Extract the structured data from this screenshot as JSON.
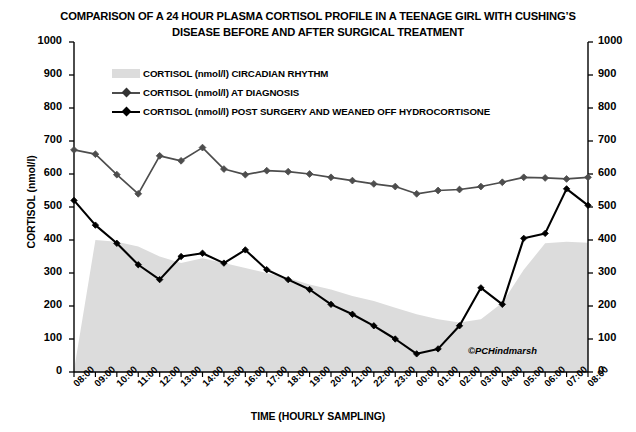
{
  "chart_data": {
    "type": "line",
    "title": "COMPARISON OF A 24 HOUR PLASMA CORTISOL PROFILE IN A TEENAGE GIRL WITH CUSHING’S DISEASE BEFORE AND AFTER SURGICAL TREATMENT",
    "xlabel": "TIME (HOURLY SAMPLING)",
    "ylabel": "CORTISOL (nmol/l)",
    "ylim": [
      0,
      1000
    ],
    "yticks": [
      0,
      100,
      200,
      300,
      400,
      500,
      600,
      700,
      800,
      900,
      1000
    ],
    "ytick_labels": [
      "0",
      "100",
      "200",
      "300",
      "400",
      "500",
      "600",
      "700",
      "800",
      "900",
      "1000"
    ],
    "grid": false,
    "legend_position": "upper-left-inside",
    "dual_y_axis": true,
    "categories": [
      "08:00",
      "09:00",
      "10:00",
      "11:00",
      "12:00",
      "13:00",
      "14:00",
      "15:00",
      "16:00",
      "17:00",
      "18:00",
      "19:00",
      "20:00",
      "21:00",
      "22:00",
      "23:00",
      "00:00",
      "01:00",
      "02:00",
      "03:00",
      "04:00",
      "05:00",
      "06:00",
      "07:00",
      "08:00"
    ],
    "series": [
      {
        "name": "CORTISOL (nmol/l) CIRCADIAN RHYTHM",
        "type": "area",
        "color": "#dcdcdc",
        "values": [
          5,
          400,
          395,
          380,
          350,
          330,
          345,
          330,
          315,
          300,
          285,
          265,
          250,
          230,
          215,
          195,
          175,
          160,
          150,
          160,
          210,
          310,
          390,
          395,
          392
        ]
      },
      {
        "name": "CORTISOL (nmol/l) AT DIAGNOSIS",
        "type": "line",
        "color": "#4d4d4d",
        "marker": "diamond",
        "values": [
          673,
          660,
          598,
          540,
          655,
          640,
          680,
          615,
          598,
          610,
          607,
          600,
          590,
          580,
          570,
          562,
          540,
          550,
          553,
          562,
          575,
          590,
          588,
          585,
          590
        ]
      },
      {
        "name": "CORTISOL (nmol/l) POST SURGERY AND WEANED OFF HYDROCORTISONE",
        "type": "line",
        "color": "#000000",
        "marker": "diamond",
        "values": [
          520,
          445,
          390,
          325,
          280,
          350,
          360,
          330,
          370,
          310,
          280,
          250,
          205,
          175,
          140,
          100,
          55,
          70,
          140,
          255,
          205,
          405,
          420,
          555,
          505
        ]
      }
    ],
    "annotation": "©PCHindmarsh"
  },
  "legend": {
    "items": [
      {
        "label": "CORTISOL (nmol/l) CIRCADIAN RHYTHM",
        "swatch": "band"
      },
      {
        "label": "CORTISOL (nmol/l) AT DIAGNOSIS",
        "swatch": "line-diamond-grey"
      },
      {
        "label": "CORTISOL (nmol/l) POST SURGERY AND WEANED OFF HYDROCORTISONE",
        "swatch": "line-diamond-black"
      }
    ]
  }
}
